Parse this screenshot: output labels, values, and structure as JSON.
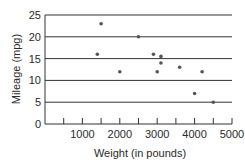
{
  "chart_data": {
    "type": "scatter",
    "title": "",
    "xlabel": "Weight (in pounds)",
    "ylabel": "Mileage (mpg)",
    "xlim": [
      0,
      5200
    ],
    "ylim": [
      0,
      25
    ],
    "x_ticks": [
      500,
      1000,
      1500,
      2000,
      2500,
      3000,
      3500,
      4000,
      4500,
      5000
    ],
    "x_tick_labels": [
      "1000",
      "2000",
      "3000",
      "4000",
      "5000"
    ],
    "y_ticks": [
      0,
      5,
      10,
      15,
      20,
      25
    ],
    "y_tick_labels": [
      "0",
      "5",
      "10",
      "15",
      "20",
      "25"
    ],
    "grid": "horizontal",
    "legend": null,
    "series": [
      {
        "name": "cars",
        "color": "#555555",
        "points": [
          {
            "x": 1400,
            "y": 16
          },
          {
            "x": 1500,
            "y": 23
          },
          {
            "x": 2000,
            "y": 12
          },
          {
            "x": 2500,
            "y": 20
          },
          {
            "x": 2900,
            "y": 16
          },
          {
            "x": 3000,
            "y": 12
          },
          {
            "x": 3100,
            "y": 15.5
          },
          {
            "x": 3100,
            "y": 14
          },
          {
            "x": 3600,
            "y": 13
          },
          {
            "x": 4000,
            "y": 7
          },
          {
            "x": 4200,
            "y": 12
          },
          {
            "x": 4500,
            "y": 5
          }
        ]
      }
    ]
  }
}
